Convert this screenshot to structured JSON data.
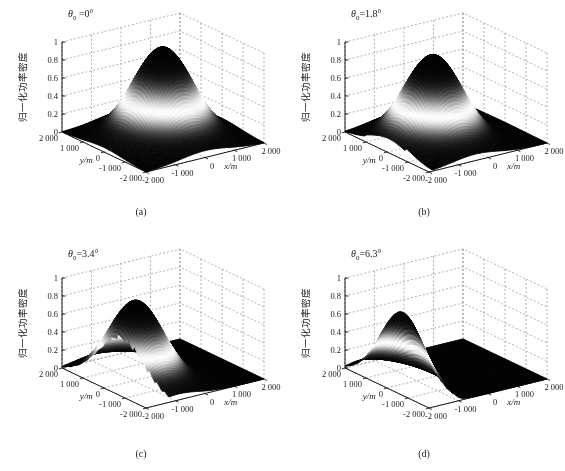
{
  "figure": {
    "background": "#ffffff",
    "text_color": "#222222",
    "grid_color": "#8f8f8f",
    "axis_color": "#000000"
  },
  "chart_data": {
    "type": "surface",
    "layout": {
      "rows": 2,
      "cols": 2,
      "view": {
        "azimuth_deg": -37.5,
        "elevation_deg": 30
      },
      "grid": true,
      "colormap_description": "grayscale band: black base, bright band on mid slope, dark cap at peak"
    },
    "axes": {
      "xlabel": "x/m",
      "ylabel": "y/m",
      "zlabel": "归一化功率密度",
      "x_range": [
        -2000,
        2000
      ],
      "y_range": [
        -2000,
        2000
      ],
      "z_range": [
        0,
        1
      ],
      "x_tick_values": [
        -2000,
        -1000,
        0,
        1000,
        2000
      ],
      "x_tick_labels": [
        "-2 000",
        "-1 000",
        "0",
        "1 000",
        "2 000"
      ],
      "y_tick_values": [
        -2000,
        -1000,
        0,
        1000,
        2000
      ],
      "y_tick_labels": [
        "-2 000",
        "-1 000",
        "0",
        "1 000",
        "2 000"
      ],
      "z_tick_values": [
        0,
        0.2,
        0.4,
        0.6,
        0.8,
        1
      ],
      "z_tick_labels": [
        "0",
        "0.2",
        "0.4",
        "0.6",
        "0.8",
        "1"
      ]
    },
    "subplots": [
      {
        "caption": "(a)",
        "title": {
          "symbol": "θ",
          "sub": "0",
          "eq": " =0°"
        },
        "tilt_deg": 0,
        "peak": 1.0,
        "center_x": 0,
        "center_y": 0,
        "sigma_x": 820,
        "sigma_y": 880,
        "domain_clip_m": 0
      },
      {
        "caption": "(b)",
        "title": {
          "symbol": "θ",
          "sub": "0",
          "eq": "=1.8°"
        },
        "tilt_deg": 1.8,
        "peak": 0.95,
        "center_x": -430,
        "center_y": 0,
        "sigma_x": 780,
        "sigma_y": 880,
        "domain_clip_m": 120
      },
      {
        "caption": "(c)",
        "title": {
          "symbol": "θ",
          "sub": "0",
          "eq": "=3.4°"
        },
        "tilt_deg": 3.4,
        "peak": 0.88,
        "center_x": -900,
        "center_y": 0,
        "sigma_x": 700,
        "sigma_y": 880,
        "domain_clip_m": 800
      },
      {
        "caption": "(d)",
        "title": {
          "symbol": "θ",
          "sub": "0",
          "eq": "=6.3°"
        },
        "tilt_deg": 6.3,
        "peak": 0.8,
        "center_x": -1500,
        "center_y": 0,
        "sigma_x": 420,
        "sigma_y": 840,
        "domain_clip_m": 1100
      }
    ]
  }
}
